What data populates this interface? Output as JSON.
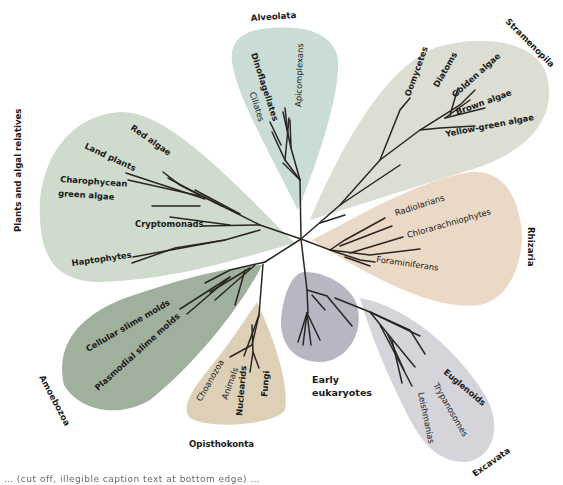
{
  "diagram": {
    "type": "unrooted phylogenetic tree of eukaryotes",
    "colors": {
      "alveolata": "#c9dcd6",
      "stramenopila": "#dcddd3",
      "rhizaria": "#ead9c6",
      "plants": "#cfdccd",
      "amoebozoa": "#9fb19c",
      "opisthokonta": "#ddd0b6",
      "early": "#b7b6c2",
      "excavata": "#d4d4da",
      "branch": "#2a2522"
    },
    "supergroups": {
      "alveolata": {
        "label": "Alveolata",
        "taxa": [
          "Dinoflagellates",
          "Apicomplexans",
          "Ciliates"
        ]
      },
      "stramenopila": {
        "label": "Stramenopila",
        "taxa": [
          "Oomycetes",
          "Diatoms",
          "Golden algae",
          "Brown algae",
          "Yellow-green algae"
        ]
      },
      "rhizaria": {
        "label": "Rhizaria",
        "taxa": [
          "Radiolarians",
          "Chlorarachniophytes",
          "Foraminiferans"
        ]
      },
      "plants": {
        "label": "Plants and algal relatives",
        "taxa": [
          "Red algae",
          "Land plants",
          "Charophycean",
          "green algae",
          "Cryptomonads",
          "Haptophytes"
        ]
      },
      "amoebozoa": {
        "label": "Amoebozoa",
        "taxa": [
          "Cellular slime molds",
          "Plasmodial slime molds"
        ]
      },
      "opisthokonta": {
        "label": "Opisthokonta",
        "taxa": [
          "Choanozoa",
          "Animals",
          "Nuclearids",
          "Fungi"
        ]
      },
      "early": {
        "label_line1": "Early",
        "label_line2": "eukaryotes"
      },
      "excavata": {
        "label": "Excavata",
        "taxa": [
          "Euglenoids",
          "Trypanosomes",
          "Leishmanias"
        ]
      }
    },
    "caption_partial": "… (cut off, illegible caption text at bottom edge) …"
  }
}
